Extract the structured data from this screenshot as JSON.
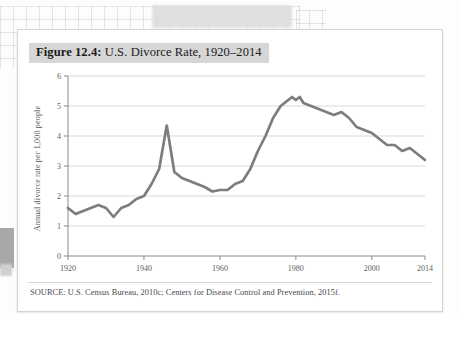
{
  "figure": {
    "label": "Figure 12.4:",
    "title": " U.S. Divorce Rate, 1920–2014",
    "source": "SOURCE: U.S. Census Bureau, 2010c; Centers for Disease Control and Prevention, 2015f."
  },
  "colors": {
    "line": "#7d7d7d",
    "gridline": "#d9d9d9",
    "axis": "#8a8a8a",
    "title_band": "#d6d6d6",
    "card_border": "#d3d3d3",
    "tick_text": "#606060"
  },
  "chart_data": {
    "type": "line",
    "title": "U.S. Divorce Rate, 1920–2014",
    "xlabel": "",
    "ylabel": "Annual divorce rate per 1,000 people",
    "xlim": [
      1920,
      2014
    ],
    "ylim": [
      0,
      6
    ],
    "xticks": [
      1920,
      1940,
      1960,
      1980,
      2000,
      2014
    ],
    "xticklabels": [
      "1920",
      "1940",
      "1960",
      "1980",
      "2000",
      "2014"
    ],
    "yticks": [
      0,
      1,
      2,
      3,
      4,
      5,
      6
    ],
    "yticklabels": [
      "0",
      "1",
      "2",
      "3",
      "4",
      "5",
      "6"
    ],
    "grid": "horizontal",
    "legend": "none",
    "series": [
      {
        "name": "Annual divorce rate per 1,000 people",
        "x": [
          1920,
          1922,
          1924,
          1926,
          1928,
          1930,
          1932,
          1934,
          1936,
          1938,
          1940,
          1942,
          1944,
          1946,
          1948,
          1950,
          1952,
          1954,
          1956,
          1958,
          1960,
          1962,
          1964,
          1966,
          1968,
          1970,
          1972,
          1974,
          1976,
          1978,
          1979,
          1980,
          1981,
          1982,
          1984,
          1986,
          1988,
          1990,
          1992,
          1994,
          1996,
          1998,
          2000,
          2002,
          2004,
          2006,
          2008,
          2010,
          2012,
          2014
        ],
        "values": [
          1.6,
          1.4,
          1.5,
          1.6,
          1.7,
          1.6,
          1.3,
          1.6,
          1.7,
          1.9,
          2.0,
          2.4,
          2.9,
          4.35,
          2.8,
          2.6,
          2.5,
          2.4,
          2.3,
          2.15,
          2.2,
          2.2,
          2.4,
          2.5,
          2.9,
          3.5,
          4.0,
          4.6,
          5.0,
          5.2,
          5.3,
          5.2,
          5.3,
          5.1,
          5.0,
          4.9,
          4.8,
          4.7,
          4.8,
          4.6,
          4.3,
          4.2,
          4.1,
          3.9,
          3.7,
          3.7,
          3.5,
          3.6,
          3.4,
          3.2
        ]
      }
    ]
  }
}
